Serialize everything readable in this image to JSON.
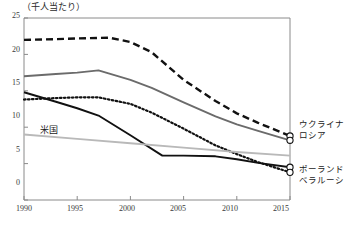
{
  "chart_data": {
    "type": "line",
    "title": "（千人当たり）",
    "xlabel": "",
    "ylabel": "",
    "xlim": [
      1990,
      2015
    ],
    "ylim": [
      0,
      25
    ],
    "xticks": [
      "1990",
      "1995",
      "2000",
      "2005",
      "2010",
      "2015"
    ],
    "yticks": [
      "0",
      "5",
      "10",
      "15",
      "20",
      "25"
    ],
    "grid": false,
    "legend_position": "right-edge-inline",
    "series": [
      {
        "name": "ウクライナ",
        "style": "dashed",
        "color": "#111111",
        "x": [
          1990,
          1993,
          1995,
          1998,
          2000,
          2002,
          2005,
          2008,
          2010,
          2012,
          2015
        ],
        "values": [
          22.0,
          22.1,
          22.2,
          22.3,
          21.7,
          20.3,
          16.5,
          13.6,
          11.9,
          10.6,
          8.8
        ]
      },
      {
        "name": "ロシア",
        "style": "solid",
        "color": "#6b6b6b",
        "x": [
          1990,
          1993,
          1995,
          1997,
          2000,
          2002,
          2005,
          2008,
          2010,
          2012,
          2015
        ],
        "values": [
          17.0,
          17.3,
          17.5,
          17.8,
          16.5,
          15.4,
          13.4,
          11.5,
          10.4,
          9.5,
          8.2
        ]
      },
      {
        "name": "ポーランド",
        "style": "solid",
        "color": "#111111",
        "x": [
          1990,
          1993,
          1995,
          1997,
          2000,
          2003,
          2005,
          2008,
          2010,
          2012,
          2015
        ],
        "values": [
          14.8,
          13.5,
          12.6,
          11.6,
          8.9,
          6.1,
          6.1,
          6.0,
          5.6,
          5.1,
          4.5
        ]
      },
      {
        "name": "ベラルーシ",
        "style": "dotted",
        "color": "#111111",
        "x": [
          1990,
          1993,
          1995,
          1997,
          2000,
          2002,
          2005,
          2008,
          2010,
          2012,
          2015
        ],
        "values": [
          13.8,
          14.0,
          14.1,
          14.1,
          13.2,
          12.0,
          9.8,
          7.5,
          6.3,
          5.2,
          3.8
        ]
      },
      {
        "name": "米国",
        "style": "solid",
        "color": "#b9b9b9",
        "x": [
          1990,
          1995,
          2000,
          2005,
          2010,
          2015
        ],
        "values": [
          9.0,
          8.4,
          7.8,
          7.2,
          6.6,
          6.1
        ]
      }
    ],
    "inline_annotations": [
      {
        "text": "米国",
        "x": 1993.2,
        "y": 10.6
      }
    ],
    "edge_labels": [
      {
        "text": "ウクライナ"
      },
      {
        "text": "ロシア"
      },
      {
        "text": "ポーランド"
      },
      {
        "text": "ベラルーシ"
      }
    ]
  }
}
